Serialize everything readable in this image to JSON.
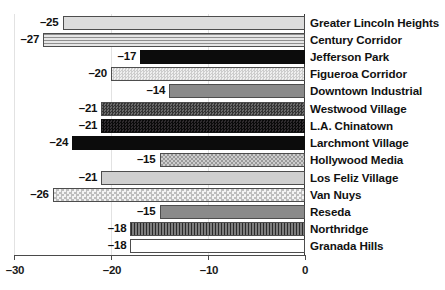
{
  "chart_data": {
    "type": "bar",
    "orientation": "horizontal",
    "title": "",
    "subtitle": "",
    "xlabel": "",
    "ylabel": "",
    "xlim": [
      -30,
      0
    ],
    "xticks": [
      -30,
      -20,
      -10,
      0
    ],
    "xtick_labels": [
      "–30",
      "–20",
      "–10",
      "0"
    ],
    "grid": true,
    "grid_axis": "x",
    "legend": false,
    "legend_position": "none",
    "categories": [
      "Greater Lincoln Heights",
      "Century Corridor",
      "Jefferson Park",
      "Figueroa Corridor",
      "Downtown Industrial",
      "Westwood Village",
      "L.A. Chinatown",
      "Larchmont Village",
      "Hollywood Media",
      "Los Feliz Village",
      "Van Nuys",
      "Reseda",
      "Northridge",
      "Granada Hills"
    ],
    "values": [
      -25,
      -27,
      -17,
      -20,
      -14,
      -21,
      -21,
      -24,
      -15,
      -21,
      -26,
      -15,
      -18,
      -18
    ],
    "value_labels": [
      "–25",
      "–27",
      "–17",
      "–20",
      "–14",
      "–21",
      "–21",
      "–24",
      "–15",
      "–21",
      "–26",
      "–15",
      "–18",
      "–18"
    ],
    "bar_fills": [
      "solid-light",
      "horizontal-lines",
      "black",
      "checker-light",
      "solid-midgray",
      "checker-dark",
      "checker-black",
      "black",
      "checker-mid",
      "solid-lightgray",
      "checker-coarse-light",
      "solid-midgray",
      "vertical-lines",
      "white"
    ],
    "colors": {
      "background": "#ffffff",
      "axis": "#4a4a4a",
      "gridline": "#e2e2e2",
      "bar_outline": "#4d4d4d",
      "text": "#111111"
    }
  }
}
